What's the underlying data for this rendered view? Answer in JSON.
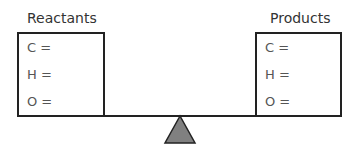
{
  "left": {
    "title": "Reactants",
    "rows": [
      "C =",
      "H =",
      "O ="
    ]
  },
  "right": {
    "title": "Products",
    "rows": [
      "C =",
      "H =",
      "O ="
    ]
  },
  "colors": {
    "stroke": "#222222",
    "fulcrum": "#808080",
    "text": "#555555"
  }
}
